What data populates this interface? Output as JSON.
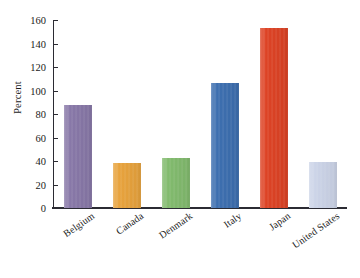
{
  "chart_data": {
    "type": "bar",
    "title": "",
    "subtitle": "",
    "xlabel": "",
    "ylabel": "Percent",
    "categories": [
      "Belgium",
      "Canada",
      "Denmark",
      "Italy",
      "Japan",
      "United States"
    ],
    "values": [
      88,
      38,
      42.5,
      106,
      153,
      39
    ],
    "series": [
      {
        "name": "Percent",
        "values": [
          88,
          38,
          42.5,
          106,
          153,
          39
        ]
      }
    ],
    "bar_colors": [
      "#8878a8",
      "#e8a33d",
      "#82bb6e",
      "#3d6fb0",
      "#dd4325",
      "#ccd4e8"
    ],
    "ylim": [
      0,
      160
    ],
    "yticks": [
      0,
      20,
      40,
      60,
      80,
      100,
      120,
      140,
      160
    ],
    "ytick_labels": [
      "0",
      "20",
      "40",
      "60",
      "80",
      "100",
      "120",
      "140",
      "160"
    ],
    "grid": false,
    "legend": false,
    "legend_position": "none",
    "xtick_rotation": -35,
    "annotations": []
  },
  "axes": {
    "y_title": "Percent"
  }
}
